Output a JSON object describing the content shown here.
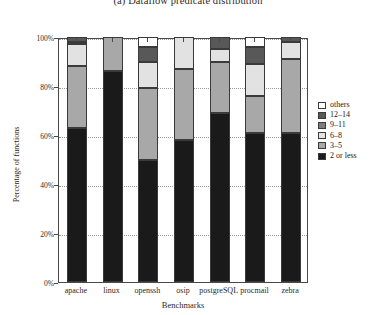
{
  "figure": {
    "caption": "(a) Dataflow predicate distribution"
  },
  "axes": {
    "ylabel": "Percentage of functions",
    "xlabel": "Benchmarks",
    "yticks": [
      "100%",
      "80%",
      "60%",
      "40%",
      "20%",
      "0%"
    ],
    "ytick_values": [
      100,
      80,
      60,
      40,
      20,
      0
    ]
  },
  "legend": {
    "position": "right",
    "entries": [
      {
        "label": "others",
        "color": "#ffffff"
      },
      {
        "label": "12–14",
        "color": "#585858"
      },
      {
        "label": "9–11",
        "color": "#7d7d7d"
      },
      {
        "label": "6–8",
        "color": "#e2e2e2"
      },
      {
        "label": "3–5",
        "color": "#a8a8a8"
      },
      {
        "label": "2 or less",
        "color": "#1a1a1a"
      }
    ]
  },
  "chart_data": {
    "type": "bar",
    "stacked": true,
    "title": "(a) Dataflow predicate distribution",
    "xlabel": "Benchmarks",
    "ylabel": "Percentage of functions",
    "ylim": [
      0,
      100
    ],
    "grid": true,
    "categories": [
      "apache",
      "linux",
      "openssh",
      "osip",
      "postgreSQL",
      "procmail",
      "zebra"
    ],
    "series": [
      {
        "name": "2 or less",
        "color": "#1a1a1a",
        "values": [
          63,
          86,
          50,
          58,
          69,
          61,
          61
        ]
      },
      {
        "name": "3–5",
        "color": "#a8a8a8",
        "values": [
          25,
          14,
          29,
          29,
          21,
          15,
          30
        ]
      },
      {
        "name": "6–8",
        "color": "#e2e2e2",
        "values": [
          9,
          0,
          11,
          13,
          5,
          13,
          7
        ]
      },
      {
        "name": "9–11",
        "color": "#7d7d7d",
        "values": [
          1,
          0,
          0,
          0,
          0,
          0,
          0
        ]
      },
      {
        "name": "12–14",
        "color": "#585858",
        "values": [
          2,
          0,
          6,
          0,
          5,
          7,
          2
        ]
      },
      {
        "name": "others",
        "color": "#ffffff",
        "values": [
          0,
          0,
          4,
          0,
          0,
          4,
          0
        ]
      }
    ]
  }
}
